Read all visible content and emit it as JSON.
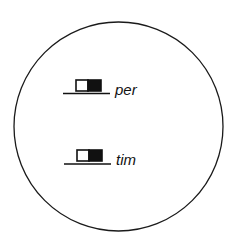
{
  "diagram": {
    "shape": "circle",
    "items": [
      {
        "label": "per",
        "symbol": "half-filled-box-on-line"
      },
      {
        "label": "tim",
        "symbol": "half-filled-box-on-line"
      }
    ],
    "colors": {
      "stroke": "#1a1a1a",
      "fill": "#111111",
      "background": "#ffffff"
    }
  }
}
